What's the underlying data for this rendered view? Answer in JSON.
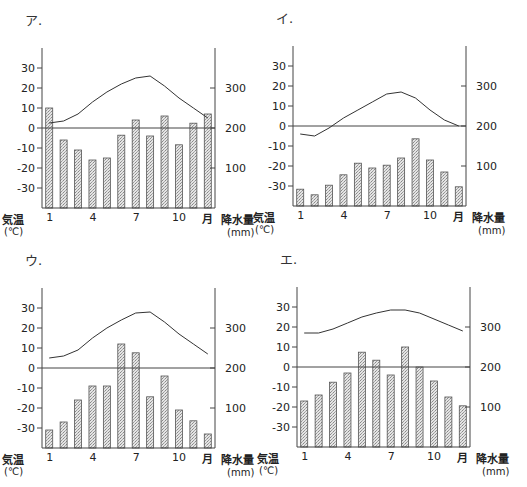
{
  "chart_data": [
    {
      "id": "a",
      "type": "bar+line",
      "title": "ア.",
      "categories": [
        "1",
        "2",
        "3",
        "4",
        "5",
        "6",
        "7",
        "8",
        "9",
        "10",
        "11",
        "12"
      ],
      "x_tick_labels": [
        "1",
        "4",
        "7",
        "10"
      ],
      "x_unit_label": "月",
      "left_axis": {
        "label": "気温",
        "unit": "(℃)",
        "ticks": [
          "30",
          "20",
          "10",
          "0",
          "-10",
          "-20",
          "-30"
        ],
        "range": [
          -40,
          40
        ]
      },
      "right_axis": {
        "label": "降水量",
        "unit": "(mm)",
        "ticks": [
          "300",
          "200",
          "100"
        ],
        "range": [
          0,
          400
        ]
      },
      "series": [
        {
          "name": "降水量",
          "kind": "bar",
          "axis": "right",
          "values": [
            250,
            170,
            145,
            120,
            125,
            182,
            220,
            180,
            230,
            158,
            212,
            235
          ]
        },
        {
          "name": "気温",
          "kind": "line",
          "axis": "left",
          "values": [
            2.5,
            3.5,
            7,
            13,
            18,
            22,
            25,
            26,
            21,
            15,
            10,
            5
          ]
        }
      ]
    },
    {
      "id": "b",
      "type": "bar+line",
      "title": "イ.",
      "categories": [
        "1",
        "2",
        "3",
        "4",
        "5",
        "6",
        "7",
        "8",
        "9",
        "10",
        "11",
        "12"
      ],
      "x_tick_labels": [
        "1",
        "4",
        "7",
        "10"
      ],
      "x_unit_label": "月",
      "left_axis": {
        "label": "気温",
        "unit": "(℃)",
        "ticks": [
          "30",
          "20",
          "10",
          "0",
          "-10",
          "-20",
          "-30"
        ],
        "range": [
          -40,
          40
        ]
      },
      "right_axis": {
        "label": "降水量",
        "unit": "(mm)",
        "ticks": [
          "300",
          "200",
          "100"
        ],
        "range": [
          0,
          400
        ]
      },
      "series": [
        {
          "name": "降水量",
          "kind": "bar",
          "axis": "right",
          "values": [
            42,
            28,
            52,
            78,
            107,
            95,
            102,
            120,
            168,
            115,
            85,
            48
          ]
        },
        {
          "name": "気温",
          "kind": "line",
          "axis": "left",
          "values": [
            -4,
            -5,
            -1,
            4,
            8,
            12,
            16,
            17,
            14,
            8,
            3,
            0
          ]
        }
      ]
    },
    {
      "id": "c",
      "type": "bar+line",
      "title": "ウ.",
      "categories": [
        "1",
        "2",
        "3",
        "4",
        "5",
        "6",
        "7",
        "8",
        "9",
        "10",
        "11",
        "12"
      ],
      "x_tick_labels": [
        "1",
        "4",
        "7",
        "10"
      ],
      "x_unit_label": "月",
      "left_axis": {
        "label": "気温",
        "unit": "(℃)",
        "ticks": [
          "30",
          "20",
          "10",
          "0",
          "-10",
          "-20",
          "-30"
        ],
        "range": [
          -40,
          40
        ]
      },
      "right_axis": {
        "label": "降水量",
        "unit": "(mm)",
        "ticks": [
          "300",
          "200",
          "100"
        ],
        "range": [
          0,
          400
        ]
      },
      "series": [
        {
          "name": "降水量",
          "kind": "bar",
          "axis": "right",
          "values": [
            45,
            65,
            120,
            155,
            155,
            260,
            238,
            128,
            180,
            95,
            68,
            35
          ]
        },
        {
          "name": "気温",
          "kind": "line",
          "axis": "left",
          "values": [
            5,
            6,
            9,
            15,
            20,
            24,
            27.5,
            28,
            23,
            17,
            12,
            7
          ]
        }
      ]
    },
    {
      "id": "d",
      "type": "bar+line",
      "title": "エ.",
      "categories": [
        "1",
        "2",
        "3",
        "4",
        "5",
        "6",
        "7",
        "8",
        "9",
        "10",
        "11",
        "12"
      ],
      "x_tick_labels": [
        "1",
        "4",
        "7",
        "10"
      ],
      "x_unit_label": "月",
      "left_axis": {
        "label": "気温",
        "unit": "(℃)",
        "ticks": [
          "30",
          "20",
          "10",
          "0",
          "-10",
          "-20",
          "-30"
        ],
        "range": [
          -40,
          40
        ]
      },
      "right_axis": {
        "label": "降水量",
        "unit": "(mm)",
        "ticks": [
          "300",
          "200",
          "100"
        ],
        "range": [
          0,
          400
        ]
      },
      "series": [
        {
          "name": "降水量",
          "kind": "bar",
          "axis": "right",
          "values": [
            115,
            130,
            162,
            185,
            237,
            217,
            180,
            250,
            200,
            165,
            125,
            103
          ]
        },
        {
          "name": "気温",
          "kind": "line",
          "axis": "left",
          "values": [
            17,
            17,
            19,
            22,
            25,
            27,
            28.5,
            28.5,
            27,
            24,
            21,
            18
          ]
        }
      ]
    }
  ],
  "colors": {
    "axis": "#444444",
    "bar_fill": "#cfcfcf",
    "bar_stroke": "#555555",
    "line": "#333333"
  }
}
